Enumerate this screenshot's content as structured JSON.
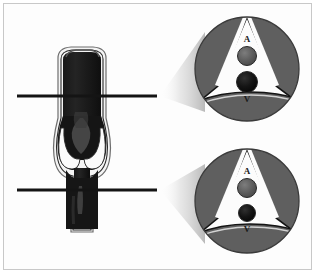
{
  "figure": {
    "caption": "",
    "background_color": "#ffffff",
    "frame_color": "#8a8a8a"
  },
  "palette": {
    "vein_lumen": "#1a1a1a",
    "vein_lumen_highlight": "#4a4a4a",
    "vein_wall_outline": "#2a2a2a",
    "vein_wall_fill": "#f2f2f2",
    "muscle_tissue": "#5f5f5f",
    "muscle_outline": "#1c1c1c",
    "fascia_background": "#fbfbfb",
    "artery_fill": "#585858",
    "vein_fill": "#121212",
    "section_line": "#141414",
    "cone_shadow": "#b9b9b9",
    "label_text": "#1a1a1a"
  },
  "longitudinal_view": {
    "name": "venous-valve-longitudinal-section",
    "description": "Vein segment shown in long axis with a bulging valve sinus and two cusps",
    "vessel": {
      "lumen_label": "vein lumen",
      "wall_label": "vein wall",
      "valve_label": "bicuspid venous valve"
    },
    "section_lines": [
      {
        "id": "upper",
        "label": "upper section level",
        "y": 96
      },
      {
        "id": "lower",
        "label": "lower section level",
        "y": 190
      }
    ]
  },
  "insets": [
    {
      "id": "upper-inset",
      "name": "cross-section-upper",
      "description": "Transverse section at the level of the valve sinus",
      "labels": [
        {
          "id": "artery",
          "text": "A",
          "meaning": "artery"
        },
        {
          "id": "vein",
          "text": "V",
          "meaning": "vein"
        }
      ],
      "vein_size": "dilated",
      "artery_size": "normal"
    },
    {
      "id": "lower-inset",
      "name": "cross-section-lower",
      "description": "Transverse section below the valve sinus",
      "labels": [
        {
          "id": "artery",
          "text": "A",
          "meaning": "artery"
        },
        {
          "id": "vein",
          "text": "V",
          "meaning": "vein"
        }
      ],
      "vein_size": "normal",
      "artery_size": "normal"
    }
  ]
}
